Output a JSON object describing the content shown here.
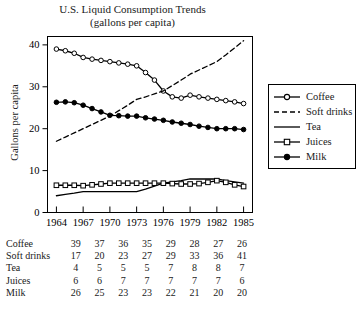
{
  "chart_data": {
    "type": "line",
    "title": "U.S. Liquid Consumption Trends",
    "subtitle": "(gallons per capita)",
    "xlabel": "",
    "ylabel": "Gallons per capita",
    "xlim": [
      1963,
      1986
    ],
    "ylim": [
      0,
      42
    ],
    "yticks": [
      0,
      10,
      20,
      30,
      40
    ],
    "xticks": [
      1964,
      1967,
      1970,
      1973,
      1976,
      1979,
      1982,
      1985
    ],
    "grid": false,
    "legend_position": "right",
    "categories": [
      "1964",
      "1967",
      "1970",
      "1973",
      "1976",
      "1979",
      "1982",
      "1985"
    ],
    "series": [
      {
        "name": "Coffee",
        "marker": "open-circle",
        "linestyle": "solid",
        "color": "#000000",
        "values": [
          39,
          37,
          36,
          35,
          29,
          28,
          27,
          26
        ],
        "annual_x": [
          1964,
          1965,
          1966,
          1967,
          1968,
          1969,
          1970,
          1971,
          1972,
          1973,
          1974,
          1975,
          1976,
          1977,
          1978,
          1979,
          1980,
          1981,
          1982,
          1983,
          1984,
          1985
        ],
        "annual_y": [
          39,
          38.6,
          38,
          37,
          36.6,
          36.3,
          36,
          35.7,
          35.4,
          35,
          33.4,
          31.6,
          29,
          27.6,
          27.3,
          28,
          27.6,
          27.3,
          27,
          26.7,
          26.4,
          26
        ]
      },
      {
        "name": "Soft drinks",
        "marker": "none",
        "linestyle": "dashed",
        "color": "#000000",
        "values": [
          17,
          20,
          23,
          27,
          29,
          33,
          36,
          41
        ],
        "annual_x": [
          1964,
          1965,
          1966,
          1967,
          1968,
          1969,
          1970,
          1971,
          1972,
          1973,
          1974,
          1975,
          1976,
          1977,
          1978,
          1979,
          1980,
          1981,
          1982,
          1983,
          1984,
          1985
        ],
        "annual_y": [
          17,
          18,
          19,
          20,
          21,
          22,
          23,
          24.3,
          25.6,
          27,
          27.6,
          28.3,
          29,
          30.3,
          31.6,
          33,
          34,
          35,
          36,
          37.6,
          39.3,
          41
        ]
      },
      {
        "name": "Tea",
        "marker": "none",
        "linestyle": "solid",
        "color": "#000000",
        "values": [
          4,
          5,
          5,
          5,
          7,
          8,
          8,
          7
        ],
        "annual_x": [
          1964,
          1965,
          1966,
          1967,
          1968,
          1969,
          1970,
          1971,
          1972,
          1973,
          1974,
          1975,
          1976,
          1977,
          1978,
          1979,
          1980,
          1981,
          1982,
          1983,
          1984,
          1985
        ],
        "annual_y": [
          4,
          4.3,
          4.6,
          5,
          5,
          5,
          5,
          5,
          5,
          5,
          5.6,
          6.3,
          7,
          7.3,
          7.6,
          8,
          8,
          8,
          8,
          7.6,
          7.3,
          7
        ]
      },
      {
        "name": "Juices",
        "marker": "open-square",
        "linestyle": "solid",
        "color": "#000000",
        "values": [
          6,
          6,
          7,
          7,
          7,
          7,
          7,
          6
        ],
        "annual_x": [
          1964,
          1965,
          1966,
          1967,
          1968,
          1969,
          1970,
          1971,
          1972,
          1973,
          1974,
          1975,
          1976,
          1977,
          1978,
          1979,
          1980,
          1981,
          1982,
          1983,
          1984,
          1985
        ],
        "annual_y": [
          6.5,
          6.5,
          6.5,
          6.4,
          6.6,
          6.8,
          7,
          7,
          7,
          7,
          7,
          7,
          7,
          6.9,
          6.8,
          6.8,
          6.9,
          7.2,
          7.6,
          7.2,
          6.6,
          6.2
        ]
      },
      {
        "name": "Milk",
        "marker": "filled-circle",
        "linestyle": "solid",
        "color": "#000000",
        "values": [
          26,
          25,
          23,
          23,
          22,
          21,
          20,
          20
        ],
        "annual_x": [
          1964,
          1965,
          1966,
          1967,
          1968,
          1969,
          1970,
          1971,
          1972,
          1973,
          1974,
          1975,
          1976,
          1977,
          1978,
          1979,
          1980,
          1981,
          1982,
          1983,
          1984,
          1985
        ],
        "annual_y": [
          26.3,
          26.4,
          26.2,
          25.6,
          24.8,
          24,
          23.2,
          23.1,
          23,
          23,
          22.6,
          22.3,
          22,
          21.6,
          21.3,
          21,
          20.6,
          20.3,
          20,
          20,
          20,
          19.8
        ]
      }
    ]
  },
  "legend": {
    "items": [
      {
        "label": "Coffee",
        "sample": "line-open-circle"
      },
      {
        "label": "Soft drinks",
        "sample": "line-dashed"
      },
      {
        "label": "Tea",
        "sample": "line-solid"
      },
      {
        "label": "Juices",
        "sample": "line-open-square"
      },
      {
        "label": "Milk",
        "sample": "line-filled-circle"
      }
    ]
  },
  "table": {
    "rows": [
      {
        "label": "Coffee",
        "values": [
          "39",
          "37",
          "36",
          "35",
          "29",
          "28",
          "27",
          "26"
        ]
      },
      {
        "label": "Soft drinks",
        "values": [
          "17",
          "20",
          "23",
          "27",
          "29",
          "33",
          "36",
          "41"
        ]
      },
      {
        "label": "Tea",
        "values": [
          "4",
          "5",
          "5",
          "5",
          "7",
          "8",
          "8",
          "7"
        ]
      },
      {
        "label": "Juices",
        "values": [
          "6",
          "6",
          "7",
          "7",
          "7",
          "7",
          "7",
          "6"
        ]
      },
      {
        "label": "Milk",
        "values": [
          "26",
          "25",
          "23",
          "23",
          "22",
          "21",
          "20",
          "20"
        ]
      }
    ]
  },
  "axis": {
    "y_title": "Gallons per capita",
    "y_ticks": [
      "40",
      "30",
      "20",
      "10",
      "0"
    ],
    "x_ticks": [
      "1964",
      "1967",
      "1970",
      "1973",
      "1976",
      "1979",
      "1982",
      "1985"
    ]
  },
  "colors": {
    "ink": "#000000",
    "background": "#ffffff"
  }
}
